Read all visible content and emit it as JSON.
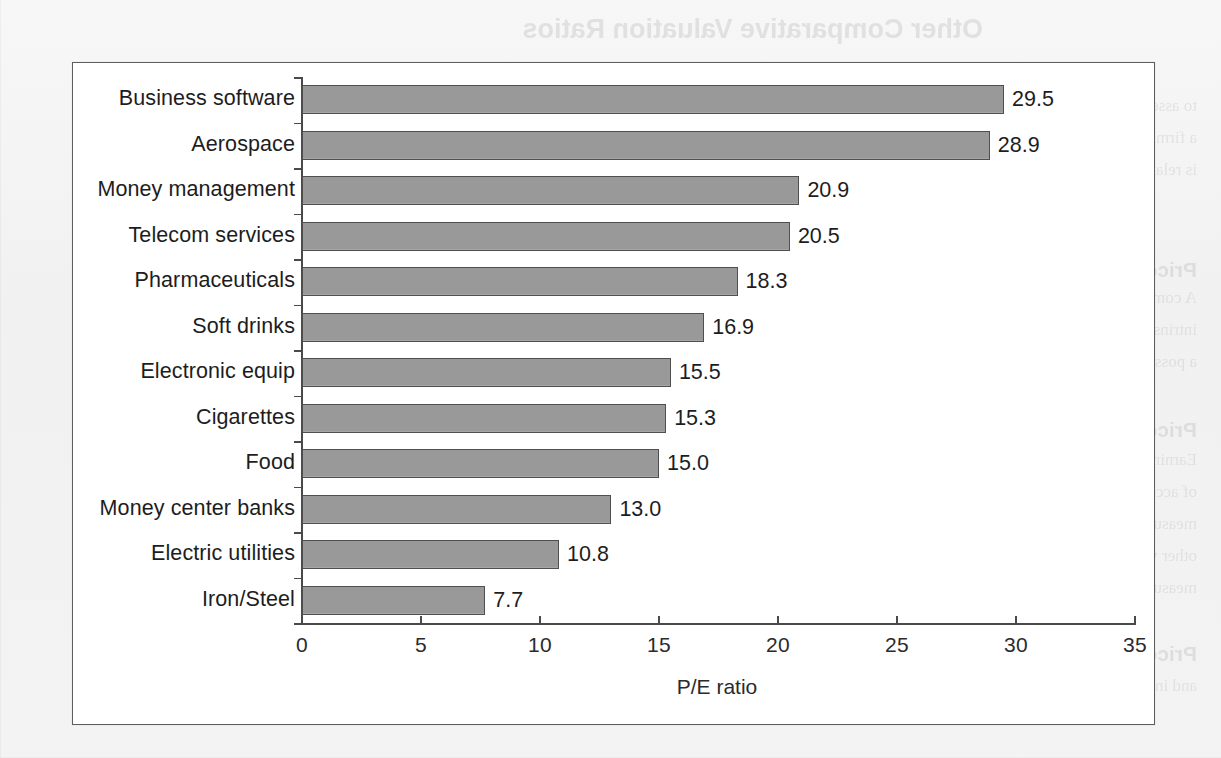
{
  "page": {
    "background_color": "#f3f3f3",
    "bleed_through_texts": [
      {
        "text": "Other Comparative Valuation Ratios",
        "x": 238,
        "y": 14,
        "size": 27,
        "head": true
      },
      {
        "text": "to assess the valuation of the high prices are assigned as the current market value and",
        "x": 24,
        "y": 96,
        "size": 17
      },
      {
        "text": "a firm. Examining the changes in the price over time and the year is the issue",
        "x": 24,
        "y": 128,
        "size": 17
      },
      {
        "text": "is relative to the pricing is in the market and the sector in the year. Two other",
        "x": 24,
        "y": 160,
        "size": 17
      },
      {
        "text": "ratios, the price-to-sales ratios, are commonly used.",
        "x": 160,
        "y": 192,
        "size": 17
      },
      {
        "text": "Price-to-Book Ratio",
        "x": 24,
        "y": 258,
        "size": 21,
        "head": true
      },
      {
        "text": "A comparison between the equity, some analysts view book value as a proxy for the",
        "x": 24,
        "y": 288,
        "size": 17
      },
      {
        "text": "intrinsic value of the firm. They compare the market price and the book value to find",
        "x": 24,
        "y": 320,
        "size": 17
      },
      {
        "text": "a possible dud.",
        "x": 24,
        "y": 352,
        "size": 17
      },
      {
        "text": "Price-to-Cash-Flow Ratio",
        "x": 24,
        "y": 418,
        "size": 21,
        "head": true
      },
      {
        "text": "Earnings as reported on the income statement can be affected by the company's choice",
        "x": 24,
        "y": 450,
        "size": 17
      },
      {
        "text": "of accounting procedures and so can be subject to some manipulation. Cash flow",
        "x": 24,
        "y": 482,
        "size": 17
      },
      {
        "text": "measures may be less affected by accounting decisions and are used as the basis of",
        "x": 24,
        "y": 514,
        "size": 17
      },
      {
        "text": "other valuation measures - the price-to-cash-flow ratio. Many analysts prefer these",
        "x": 24,
        "y": 546,
        "size": 17
      },
      {
        "text": "measures, arguing that they are more reliable than earnings.",
        "x": 24,
        "y": 578,
        "size": 17
      },
      {
        "text": "Price-to-Sales Ratio",
        "x": 24,
        "y": 642,
        "size": 21,
        "head": true
      },
      {
        "text": "Value-added by firms vary by industry. Sales revenue is",
        "x": 300,
        "y": 644,
        "size": 17
      },
      {
        "text": "and in the case of the change of the investors to remind the financial condition of a firm",
        "x": 24,
        "y": 676,
        "size": 17
      }
    ]
  },
  "chart_data": {
    "type": "bar",
    "orientation": "horizontal",
    "title": "",
    "xlabel": "P/E ratio",
    "ylabel": "",
    "xlim": [
      0,
      35
    ],
    "xticks": [
      0,
      5,
      10,
      15,
      20,
      25,
      30,
      35
    ],
    "grid": false,
    "legend": false,
    "bar_fill_color": "#9c9c9c",
    "bar_border_color": "#4f4f4f",
    "axis_color": "#4a4a4a",
    "categories": [
      "Business software",
      "Aerospace",
      "Money management",
      "Telecom services",
      "Pharmaceuticals",
      "Soft drinks",
      "Electronic equip",
      "Cigarettes",
      "Food",
      "Money center banks",
      "Electric utilities",
      "Iron/Steel"
    ],
    "values": [
      29.5,
      28.9,
      20.9,
      20.5,
      18.3,
      16.9,
      15.5,
      15.3,
      15.0,
      13.0,
      10.8,
      7.7
    ],
    "value_labels": [
      "29.5",
      "28.9",
      "20.9",
      "20.5",
      "18.3",
      "16.9",
      "15.5",
      "15.3",
      "15.0",
      "13.0",
      "10.8",
      "7.7"
    ],
    "xtick_labels": [
      "0",
      "5",
      "10",
      "15",
      "20",
      "25",
      "30",
      "35"
    ]
  }
}
